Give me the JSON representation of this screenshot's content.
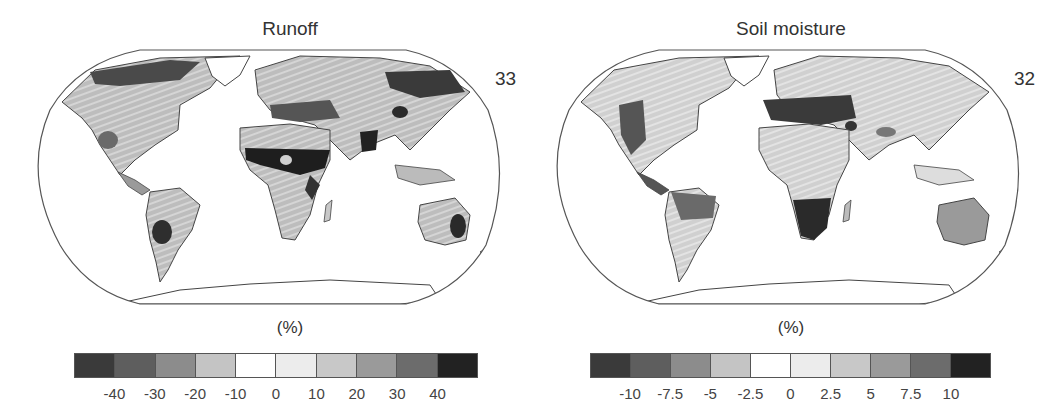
{
  "figure": {
    "panels": [
      {
        "title": "Runoff",
        "model_count": "33",
        "unit_label": "(%)",
        "colorbar": {
          "ticks": [
            "-40",
            "-30",
            "-20",
            "-10",
            "0",
            "10",
            "20",
            "30",
            "40"
          ],
          "colors": [
            "#3a3a3a",
            "#5e5e5e",
            "#8c8c8c",
            "#c4c4c4",
            "#ffffff",
            "#ececec",
            "#c8c8c8",
            "#9a9a9a",
            "#6c6c6c",
            "#222222"
          ]
        }
      },
      {
        "title": "Soil moisture",
        "model_count": "32",
        "unit_label": "(%)",
        "colorbar": {
          "ticks": [
            "-10",
            "-7.5",
            "-5",
            "-2.5",
            "0",
            "2.5",
            "5",
            "7.5",
            "10"
          ],
          "colors": [
            "#3a3a3a",
            "#5e5e5e",
            "#8c8c8c",
            "#c4c4c4",
            "#ffffff",
            "#ececec",
            "#c8c8c8",
            "#9a9a9a",
            "#6c6c6c",
            "#222222"
          ]
        }
      }
    ],
    "projection": "Robinson (global)",
    "legend_note": "Stippling/hatching indicates model agreement"
  }
}
